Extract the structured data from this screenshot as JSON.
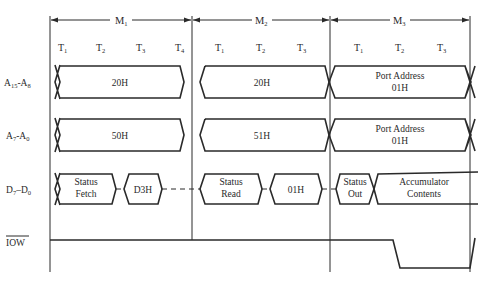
{
  "diagram": {
    "title": "",
    "machine_cycles": [
      {
        "label": "M",
        "sub": "1",
        "x_start": 50,
        "x_end": 192,
        "states": [
          {
            "label": "T",
            "sub": "1",
            "x": 62
          },
          {
            "label": "T",
            "sub": "2",
            "x": 102
          },
          {
            "label": "T",
            "sub": "3",
            "x": 142
          },
          {
            "label": "T",
            "sub": "4",
            "x": 180
          }
        ]
      },
      {
        "label": "M",
        "sub": "2",
        "x_start": 192,
        "x_end": 330,
        "states": [
          {
            "label": "T",
            "sub": "1",
            "x": 220
          },
          {
            "label": "T",
            "sub": "2",
            "x": 262
          },
          {
            "label": "T",
            "sub": "3",
            "x": 302
          }
        ]
      },
      {
        "label": "M",
        "sub": "3",
        "x_start": 330,
        "x_end": 470,
        "states": [
          {
            "label": "T",
            "sub": "1",
            "x": 358
          },
          {
            "label": "T",
            "sub": "2",
            "x": 400
          },
          {
            "label": "T",
            "sub": "3",
            "x": 442
          }
        ]
      }
    ],
    "signals": [
      {
        "name": "A15-A8",
        "label_main": "A",
        "label_sub1": "15",
        "label_mid": "-A",
        "label_sub2": "8",
        "y": 82
      },
      {
        "name": "A7-A0",
        "label_main": "A",
        "label_sub1": "7",
        "label_mid": "-A",
        "label_sub2": "0",
        "y": 135
      },
      {
        "name": "D7-D0",
        "label_main": "D",
        "label_sub1": "7",
        "label_mid": "–D",
        "label_sub2": "0",
        "y": 189
      },
      {
        "name": "IOW",
        "label_main": "IOW",
        "overline": true,
        "y": 240
      }
    ],
    "address_high": [
      {
        "text": "20H",
        "lines": [
          "20H"
        ]
      },
      {
        "text": "20H",
        "lines": [
          "20H"
        ]
      },
      {
        "text": "Port Address 01H",
        "lines": [
          "Port Address",
          "01H"
        ]
      }
    ],
    "address_low": [
      {
        "text": "50H",
        "lines": [
          "50H"
        ]
      },
      {
        "text": "51H",
        "lines": [
          "51H"
        ]
      },
      {
        "text": "Port Address 01H",
        "lines": [
          "Port Address",
          "01H"
        ]
      }
    ],
    "data_bus": [
      {
        "text": "Status Fetch",
        "lines": [
          "Status",
          "Fetch"
        ]
      },
      {
        "text": "D3H",
        "lines": [
          "D3H"
        ]
      },
      {
        "text": "Status Read",
        "lines": [
          "Status",
          "Read"
        ]
      },
      {
        "text": "01H",
        "lines": [
          "01H"
        ]
      },
      {
        "text": "Status Out",
        "lines": [
          "Status",
          "Out"
        ]
      },
      {
        "text": "Accumulator Contents",
        "lines": [
          "Accumulator",
          "Contents"
        ]
      }
    ],
    "iow_waveform": {
      "high_y": 240,
      "low_y": 268,
      "fall_start_x": 393,
      "fall_end_x": 400,
      "rise_start_x": 470,
      "rise_end_x": 475
    },
    "colors": {
      "ink": "#2a2a2a",
      "background": "#ffffff"
    }
  }
}
